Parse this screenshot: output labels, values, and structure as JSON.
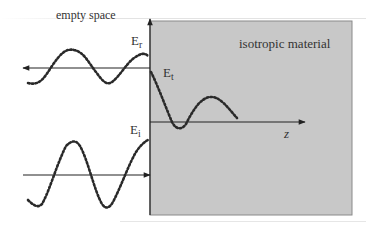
{
  "diagram": {
    "regions": {
      "left": "empty space",
      "right": "isotropic material"
    },
    "axis_label": "z",
    "waves": {
      "reflected": {
        "symbol": "E",
        "subscript": "r"
      },
      "transmitted": {
        "symbol": "E",
        "subscript": "t"
      },
      "incident": {
        "symbol": "E",
        "subscript": "i"
      }
    },
    "colors": {
      "material_fill": "#c8c8c8",
      "material_border": "#8a8a8a",
      "wave": "#2a2a2a",
      "axis": "#222222",
      "text": "#333333"
    }
  }
}
